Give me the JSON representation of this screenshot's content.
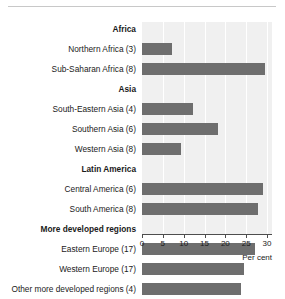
{
  "chart_data": {
    "type": "bar",
    "orientation": "horizontal",
    "title": "",
    "xlabel": "Per cent",
    "ylabel": "",
    "xlim": [
      0,
      30
    ],
    "xticks": [
      0,
      5,
      10,
      15,
      20,
      25,
      30
    ],
    "grid": true,
    "legend": null,
    "colors": {
      "bar": "#6e6e6e",
      "plot_background": "#f0f0f0",
      "gridline": "#ffffff",
      "axis": "#4d4d4d",
      "text": "#1a1a1a",
      "rule": "#c8c8c8"
    },
    "rows": [
      {
        "label": "Africa",
        "type": "group",
        "value": null
      },
      {
        "label": "Northern Africa (3)",
        "type": "data",
        "value": 7.3
      },
      {
        "label": "Sub-Saharan Africa (8)",
        "type": "data",
        "value": 29.5
      },
      {
        "label": "Asia",
        "type": "group",
        "value": null
      },
      {
        "label": "South-Eastern Asia (4)",
        "type": "data",
        "value": 12.2
      },
      {
        "label": "Southern Asia (6)",
        "type": "data",
        "value": 18.2
      },
      {
        "label": "Western Asia (8)",
        "type": "data",
        "value": 9.4
      },
      {
        "label": "Latin America",
        "type": "group",
        "value": null
      },
      {
        "label": "Central America (6)",
        "type": "data",
        "value": 29.0
      },
      {
        "label": "South America (8)",
        "type": "data",
        "value": 27.8
      },
      {
        "label": "More developed regions",
        "type": "group",
        "value": null
      },
      {
        "label": "Eastern Europe (17)",
        "type": "data",
        "value": 27.0
      },
      {
        "label": "Western Europe (17)",
        "type": "data",
        "value": 24.5
      },
      {
        "label": "Other more developed regions (4)",
        "type": "data",
        "value": 23.7
      }
    ],
    "categories": [
      "Northern Africa (3)",
      "Sub-Saharan Africa (8)",
      "South-Eastern Asia (4)",
      "Southern Asia (6)",
      "Western Asia (8)",
      "Central America (6)",
      "South America (8)",
      "Eastern Europe (17)",
      "Western Europe (17)",
      "Other more developed regions (4)"
    ],
    "values": [
      7.3,
      29.5,
      12.2,
      18.2,
      9.4,
      29.0,
      27.8,
      27.0,
      24.5,
      23.7
    ]
  }
}
